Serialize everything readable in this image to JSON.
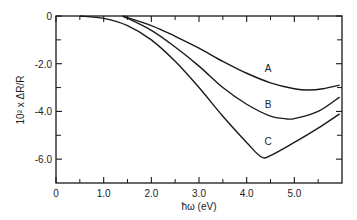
{
  "chart_data": {
    "type": "line",
    "title": "",
    "xlabel": "ħω (eV)",
    "ylabel": "10² x ΔR/R",
    "xlim": [
      0,
      6.0
    ],
    "ylim": [
      -7.0,
      0
    ],
    "grid": false,
    "x_ticks": [
      0,
      1.0,
      2.0,
      3.0,
      4.0,
      5.0
    ],
    "x_tick_labels": [
      "0",
      "1.0",
      "2.0",
      "3.0",
      "4.0",
      "5.0"
    ],
    "x_minor_ticks": [
      0.5,
      1.5,
      2.5,
      3.5,
      4.5,
      5.5
    ],
    "y_ticks": [
      0,
      -2.0,
      -4.0,
      -6.0
    ],
    "y_tick_labels": [
      "0",
      "-2.0",
      "-4.0",
      "-6.0"
    ],
    "y_minor_ticks": [
      -1.0,
      -3.0,
      -5.0
    ],
    "series": [
      {
        "name": "A",
        "label_pos": [
          4.45,
          -2.35
        ],
        "x": [
          1.4,
          2.0,
          2.5,
          3.0,
          3.5,
          4.0,
          4.5,
          5.0,
          5.3,
          5.6,
          5.95
        ],
        "values": [
          0,
          -0.4,
          -0.85,
          -1.35,
          -1.9,
          -2.4,
          -2.8,
          -3.05,
          -3.1,
          -3.05,
          -2.9
        ]
      },
      {
        "name": "B",
        "label_pos": [
          4.45,
          -3.85
        ],
        "x": [
          1.4,
          2.0,
          2.5,
          3.0,
          3.5,
          4.0,
          4.5,
          4.8,
          5.0,
          5.5,
          5.95
        ],
        "values": [
          0,
          -0.6,
          -1.3,
          -2.1,
          -3.0,
          -3.7,
          -4.2,
          -4.3,
          -4.3,
          -4.0,
          -3.4
        ]
      },
      {
        "name": "C",
        "label_pos": [
          4.45,
          -5.4
        ],
        "x": [
          0.5,
          1.0,
          1.5,
          2.0,
          2.5,
          3.0,
          3.5,
          4.0,
          4.3,
          4.5,
          5.0,
          5.5,
          5.95
        ],
        "values": [
          0,
          -0.1,
          -0.4,
          -1.0,
          -1.9,
          -3.0,
          -4.2,
          -5.3,
          -5.9,
          -5.85,
          -5.3,
          -4.7,
          -4.1
        ]
      }
    ],
    "legend": "inline labels A, B, C on curves"
  },
  "labels": {
    "xlabel": "ħω (eV)",
    "ylabel": "10² x ΔR/R"
  },
  "colors": {
    "line": "#1a1a1a",
    "axis": "#1a1a1a",
    "background": "#ffffff"
  }
}
